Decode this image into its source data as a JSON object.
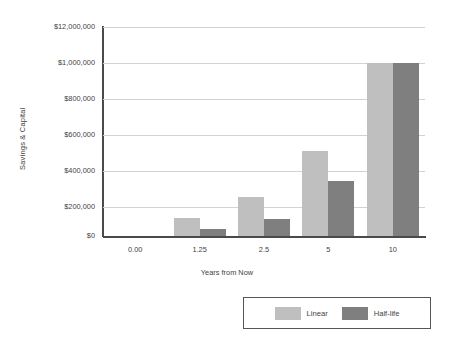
{
  "chart_data": {
    "type": "bar",
    "title": "",
    "subtitle": "",
    "xlabel": "Years from Now",
    "ylabel": "Savings & Capital",
    "categories": [
      "0.00",
      "1.25",
      "2.5",
      "5",
      "10"
    ],
    "series": [
      {
        "name": "Linear",
        "color": "#bfbfbf",
        "values": [
          0,
          125000,
          255000,
          510000,
          1000000
        ]
      },
      {
        "name": "Half-life",
        "color": "#7f7f7f",
        "values": [
          0,
          45000,
          115000,
          345000,
          1000000
        ]
      }
    ],
    "ytick_labels": [
      "$0",
      "$200,000",
      "$400,000",
      "$600,000",
      "$800,000",
      "$1,000,000",
      "$12,000,000"
    ],
    "ytick_values": [
      0,
      200000,
      400000,
      600000,
      800000,
      1000000,
      1200000
    ],
    "ylim": [
      0,
      1200000
    ],
    "grid": true,
    "legend_position": "bottom-right",
    "legend_entries": [
      "Linear",
      "Half-life"
    ]
  },
  "axes": {
    "y_title": "Savings & Capital",
    "x_title": "Years from Now"
  }
}
